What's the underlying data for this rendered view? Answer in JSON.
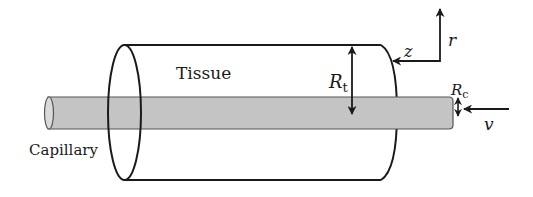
{
  "figure": {
    "type": "schematic",
    "colors": {
      "stroke": "#1a1a1a",
      "capillary_fill": "#c4c4c4",
      "capillary_end_fill": "#dadada",
      "background": "#ffffff"
    }
  },
  "labels": {
    "tissue": "Tissue",
    "capillary": "Capillary",
    "tissue_radius_main": "R",
    "tissue_radius_sub": "t",
    "capillary_radius_main": "R",
    "capillary_radius_sub": "c",
    "axis_z": "z",
    "axis_r": "r",
    "velocity": "v"
  }
}
